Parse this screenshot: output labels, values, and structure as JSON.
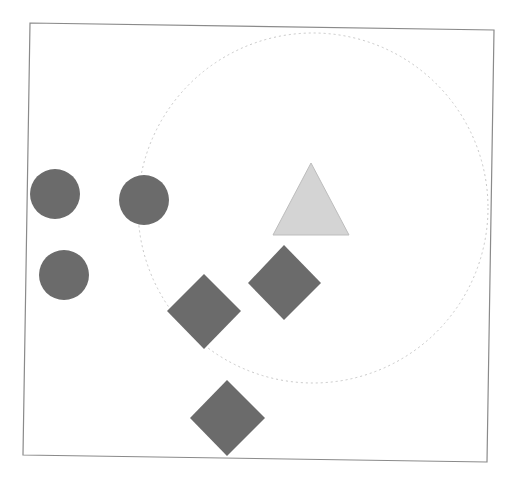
{
  "canvas": {
    "width": 512,
    "height": 482,
    "background": "#ffffff"
  },
  "frame": {
    "points": "30,23 494,30 487,462 23,455",
    "stroke": "#8a8a8a"
  },
  "region_circle": {
    "cx": 313,
    "cy": 208,
    "r": 175,
    "stroke": "#c8c8c8"
  },
  "colors": {
    "dark_shape": "#6b6b6b",
    "light_shape": "#d4d4d4"
  },
  "shapes": {
    "circles": [
      {
        "cx": 55,
        "cy": 194,
        "r": 25
      },
      {
        "cx": 144,
        "cy": 200,
        "r": 25
      },
      {
        "cx": 64,
        "cy": 275,
        "r": 25
      }
    ],
    "triangle": {
      "points": "311,163 273,235 349,235"
    },
    "diamonds": [
      {
        "points": "284,245 321,283 284,320 248,283"
      },
      {
        "points": "204,274 241,311 204,349 167,311"
      },
      {
        "points": "227,380 265,418 227,456 190,418"
      }
    ]
  }
}
